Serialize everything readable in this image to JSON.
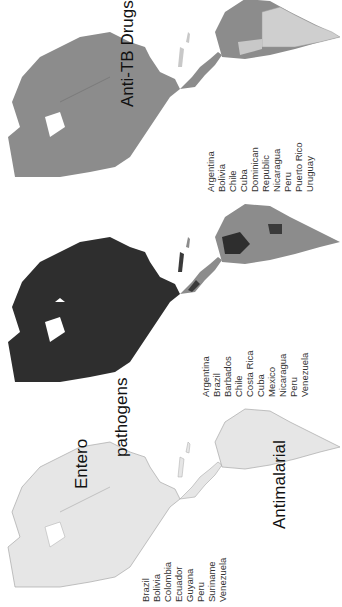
{
  "panels": [
    {
      "id": "enteropathogens",
      "title_line1": "Entero",
      "title_line2": "pathogens",
      "countries": [
        "Brazil",
        "Bolivia",
        "Colombia",
        "Ecuador",
        "Guyana",
        "Peru",
        "Suriname",
        "Venezuela"
      ],
      "shading": "light"
    },
    {
      "id": "antimalarial",
      "title": "Antimalarial",
      "countries": [
        "Argentina",
        "Brazil",
        "Barbados",
        "Chile",
        "Costa Rica",
        "Cuba",
        "Mexico",
        "Nicaragua",
        "Peru",
        "Venezuela"
      ],
      "shading": "dark"
    },
    {
      "id": "anti-tb-drugs",
      "title": "Anti-TB Drugs",
      "countries": [
        "Argentina",
        "Bolivia",
        "Chile",
        "Cuba",
        "Dominican",
        "Republic",
        "Nicaragua",
        "Peru",
        "Puerto Rico",
        "Uruguay"
      ],
      "shading": "medium"
    }
  ],
  "colors": {
    "light": "#e6e6e6",
    "light_border": "#a8a8a8",
    "medium": "#8c8c8c",
    "dark": "#3a3a3a",
    "darker": "#262626",
    "pale": "#c8c8c8"
  }
}
